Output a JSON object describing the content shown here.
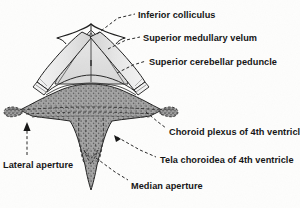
{
  "figure": {
    "background_color": "#fdfdfc",
    "ink_color": "#141414",
    "stipple_fill_color": "#9d9d9d",
    "peduncle_fill_color": "#ebebeb",
    "velum_fill_color": "#dedede"
  },
  "labels": {
    "inferior_colliculus": "Inferior colliculus",
    "superior_medullary_velum": "Superior medullary velum",
    "superior_cerebellar_peduncle": "Superior cerebellar peduncle",
    "choroid_plexus": "Choroid plexus of 4th ventricle",
    "tela_choroidea": "Tela choroidea of 4th ventricle",
    "lateral_aperture": "Lateral aperture",
    "median_aperture": "Median aperture"
  },
  "structures": {
    "inferior_colliculus_name": "inferior-colliculus",
    "superior_medullary_velum_name": "superior-medullary-velum",
    "left_peduncle_name": "left-superior-cerebellar-peduncle",
    "right_peduncle_name": "right-superior-cerebellar-peduncle",
    "tela_choroidea_name": "tela-choroidea-body",
    "choroid_plexus_name": "choroid-plexus",
    "left_lateral_aperture_name": "left-lateral-aperture",
    "right_lateral_aperture_name": "right-lateral-aperture",
    "median_aperture_name": "median-aperture"
  }
}
